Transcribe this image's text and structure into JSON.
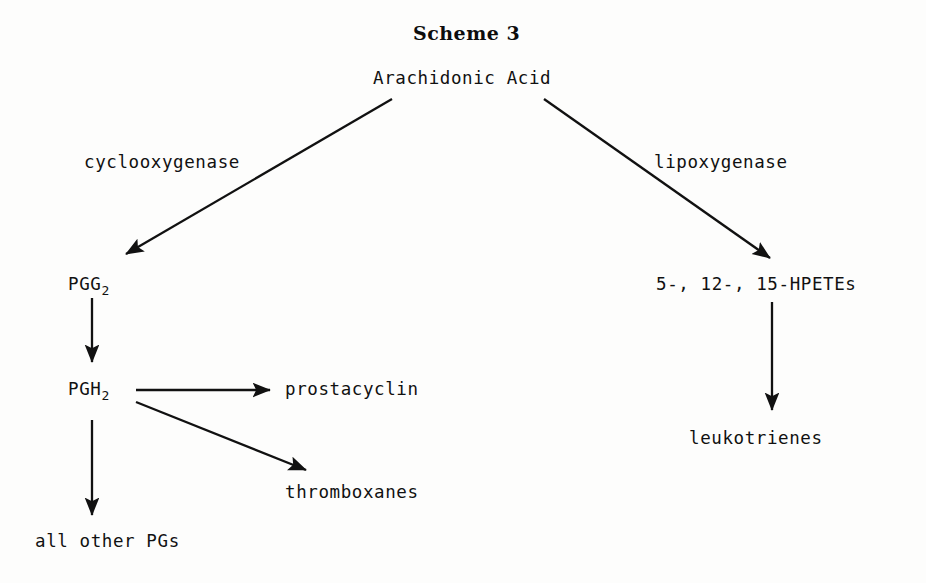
{
  "page": {
    "width": 926,
    "height": 583,
    "background_color": "#fdfdfc",
    "ink_color": "#111111"
  },
  "title": {
    "text": "Scheme 3",
    "x": 413,
    "y": 22
  },
  "diagram": {
    "type": "flowchart",
    "nodes": [
      {
        "id": "arachidonic-acid",
        "label": "Arachidonic Acid",
        "base": "Arachidonic Acid",
        "subscript": "",
        "x": 373,
        "y": 70
      },
      {
        "id": "pgg2",
        "label": "PGG2",
        "base": "PGG",
        "subscript": "2",
        "x": 68,
        "y": 276
      },
      {
        "id": "pgh2",
        "label": "PGH2",
        "base": "PGH",
        "subscript": "2",
        "x": 68,
        "y": 381
      },
      {
        "id": "prostacyclin",
        "label": "prostacyclin",
        "base": "prostacyclin",
        "subscript": "",
        "x": 285,
        "y": 381
      },
      {
        "id": "thromboxanes",
        "label": "thromboxanes",
        "base": "thromboxanes",
        "subscript": "",
        "x": 285,
        "y": 484
      },
      {
        "id": "all-other-pgs",
        "label": "all other PGs",
        "base": "all other PGs",
        "subscript": "",
        "x": 35,
        "y": 533
      },
      {
        "id": "hpetes",
        "label": "5-, 12-, 15-HPETEs",
        "base": "5-, 12-, 15-HPETEs",
        "subscript": "",
        "x": 656,
        "y": 276
      },
      {
        "id": "leukotrienes",
        "label": "leukotrienes",
        "base": "leukotrienes",
        "subscript": "",
        "x": 689,
        "y": 430
      }
    ],
    "edge_labels": [
      {
        "id": "cyclooxygenase",
        "text": "cyclooxygenase",
        "x": 84,
        "y": 154
      },
      {
        "id": "lipoxygenase",
        "text": "lipoxygenase",
        "x": 654,
        "y": 154
      }
    ],
    "edges": [
      {
        "id": "arachidonic-to-pgg2",
        "from": "arachidonic-acid",
        "to": "pgg2",
        "label": "cyclooxygenase",
        "x1": 392,
        "y1": 99,
        "x2": 122,
        "y2": 257
      },
      {
        "id": "arachidonic-to-hpetes",
        "from": "arachidonic-acid",
        "to": "hpetes",
        "label": "lipoxygenase",
        "x1": 544,
        "y1": 99,
        "x2": 774,
        "y2": 261
      },
      {
        "id": "pgg2-to-pgh2",
        "from": "pgg2",
        "to": "pgh2",
        "label": "",
        "x1": 92,
        "y1": 298,
        "x2": 92,
        "y2": 366
      },
      {
        "id": "pgh2-to-prostacyclin",
        "from": "pgh2",
        "to": "prostacyclin",
        "label": "",
        "x1": 136,
        "y1": 390,
        "x2": 274,
        "y2": 390
      },
      {
        "id": "pgh2-to-thromboxanes",
        "from": "pgh2",
        "to": "thromboxanes",
        "label": "",
        "x1": 136,
        "y1": 402,
        "x2": 310,
        "y2": 472
      },
      {
        "id": "pgh2-to-all-other-pgs",
        "from": "pgh2",
        "to": "all-other-pgs",
        "label": "",
        "x1": 92,
        "y1": 420,
        "x2": 92,
        "y2": 519
      },
      {
        "id": "hpetes-to-leukotrienes",
        "from": "hpetes",
        "to": "leukotrienes",
        "label": "",
        "x1": 772,
        "y1": 302,
        "x2": 772,
        "y2": 414
      }
    ]
  }
}
